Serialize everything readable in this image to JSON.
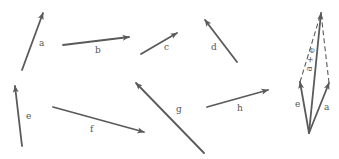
{
  "diagram": {
    "title": "",
    "stroke_color": "#5a5a5a",
    "label_color": "#555555",
    "vectors": [
      {
        "id": "a",
        "label": "a",
        "x1": 22,
        "y1": 70,
        "x2": 43,
        "y2": 13,
        "lx": 39,
        "ly": 46
      },
      {
        "id": "b",
        "label": "b",
        "x1": 63,
        "y1": 45,
        "x2": 129,
        "y2": 37,
        "lx": 95,
        "ly": 53
      },
      {
        "id": "c",
        "label": "c",
        "x1": 141,
        "y1": 54,
        "x2": 177,
        "y2": 33,
        "lx": 164,
        "ly": 50
      },
      {
        "id": "d",
        "label": "d",
        "x1": 237,
        "y1": 62,
        "x2": 205,
        "y2": 20,
        "lx": 211,
        "ly": 50
      },
      {
        "id": "e",
        "label": "e",
        "x1": 22,
        "y1": 146,
        "x2": 15,
        "y2": 86,
        "lx": 26,
        "ly": 119
      },
      {
        "id": "f",
        "label": "f",
        "x1": 53,
        "y1": 107,
        "x2": 144,
        "y2": 132,
        "lx": 90,
        "ly": 132
      },
      {
        "id": "g",
        "label": "g",
        "x1": 204,
        "y1": 153,
        "x2": 136,
        "y2": 83,
        "lx": 176,
        "ly": 112
      },
      {
        "id": "h",
        "label": "h",
        "x1": 207,
        "y1": 107,
        "x2": 268,
        "y2": 90,
        "lx": 237,
        "ly": 111
      }
    ],
    "sum_construction": {
      "origin": {
        "x": 309,
        "y": 133
      },
      "vectors": [
        {
          "id": "sum-e",
          "label": "e",
          "x2": 300,
          "y2": 82,
          "lx": 295,
          "ly": 107
        },
        {
          "id": "sum-a",
          "label": "a",
          "x2": 329,
          "y2": 83,
          "lx": 324,
          "ly": 110
        },
        {
          "id": "sum-a-plus-e",
          "label": "a + e",
          "x2": 321,
          "y2": 13,
          "lx": 313,
          "ly": 60,
          "rotate": -82
        }
      ],
      "dashed_lines": [
        {
          "id": "dash-e-to-sum",
          "x1": 300,
          "y1": 82,
          "x2": 321,
          "y2": 13
        },
        {
          "id": "dash-a-to-sum",
          "x1": 329,
          "y1": 83,
          "x2": 321,
          "y2": 13
        }
      ]
    }
  }
}
